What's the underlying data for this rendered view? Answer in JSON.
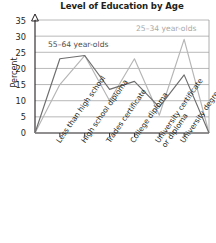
{
  "chart_data": {
    "type": "line",
    "title": "Level of Education by Age",
    "xlabel": "",
    "ylabel": "Percent",
    "ylim": [
      0,
      35
    ],
    "yticks": [
      0,
      5,
      10,
      15,
      20,
      25,
      30,
      35
    ],
    "grid": true,
    "legend_position": "inside-plot",
    "categories": [
      "Less than high school",
      "High school diploma",
      "Trades certificate",
      "College diploma",
      "University certificate or diploma",
      "University degree"
    ],
    "category_lines": [
      [
        "Less than high school"
      ],
      [
        "High school diploma"
      ],
      [
        "Trades certificate"
      ],
      [
        "College diploma"
      ],
      [
        "University certificate",
        "or diploma"
      ],
      [
        "University degree"
      ]
    ],
    "series": [
      {
        "name": "55–64 year-olds",
        "color": "#6d6d6d",
        "values": [
          23,
          24,
          13.5,
          16,
          8,
          18
        ]
      },
      {
        "name": "25–34 year-olds",
        "color": "#b5b5b5",
        "values": [
          15,
          24,
          10,
          23,
          5.5,
          29
        ]
      }
    ],
    "baseline_endpoints": 0,
    "colors": {
      "axis": "#231f20",
      "grid": "#a0a0a0",
      "text": "#231f20",
      "series_older": "#6d6d6d",
      "series_younger": "#b5b5b5"
    }
  }
}
